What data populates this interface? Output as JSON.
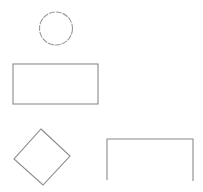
{
  "canvas": {
    "width": 203,
    "height": 192,
    "background": "#ffffff"
  },
  "style": {
    "stroke": "#8a8a8a",
    "circle_stroke": "#9a9a9a"
  },
  "shapes": {
    "circle": {
      "kind": "circle",
      "cx": 56,
      "cy": 28.5,
      "r": 16.5,
      "dashed": true
    },
    "rectangle": {
      "kind": "rectangle",
      "x": 13,
      "y": 64,
      "width": 85,
      "height": 40
    },
    "diamond": {
      "kind": "diamond",
      "points": "41,129 70,156 43,185 14,159"
    },
    "open_rectangle": {
      "kind": "open-rectangle",
      "points": "107,180 107,139 193,139 193,181"
    }
  }
}
